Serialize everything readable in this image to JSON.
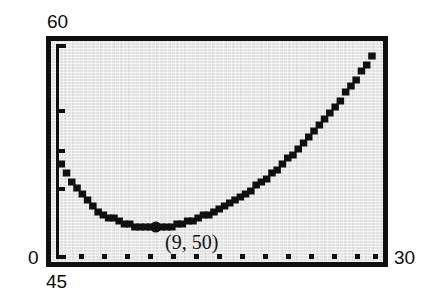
{
  "figure": {
    "kind": "graphing-calculator-screen",
    "screen_bg_color": "#e2e2e2",
    "ink_color": "#101010",
    "frame_color": "#101010"
  },
  "axis_labels": {
    "y_max": "60",
    "y_min": "0",
    "x_min": "45",
    "x_max": "30"
  },
  "annotation": {
    "point_label": "(9, 50)"
  },
  "chart_data": {
    "type": "line",
    "title": "",
    "subtitle": "",
    "xlabel": "",
    "ylabel": "",
    "xlim": [
      45,
      30
    ],
    "ylim": [
      0,
      60
    ],
    "grid": false,
    "legend": null,
    "axis_corner_labels": {
      "top_left": "60",
      "bottom_left_outside": "0",
      "below_bottom_left": "45",
      "bottom_right": "30"
    },
    "x_axis_tick_count": 15,
    "x_axis_tick_style": "dotted-marks-along-bottom",
    "y_axis_tick_count": 4,
    "y_axis_tick_style": "short-marks-on-left-axis",
    "y_axis_tick_values": [
      60,
      45,
      30,
      15
    ],
    "annotations": [
      {
        "text": "(9, 50)",
        "x": 9,
        "y": 50,
        "marker": "filled-circle"
      }
    ],
    "series": [
      {
        "name": "curve",
        "style": "thick-dotted-pixelated",
        "minimum": {
          "x": 9,
          "y": 50
        },
        "x": [
          0,
          0.5,
          1,
          1.5,
          2,
          2.5,
          3,
          3.5,
          4,
          4.5,
          5,
          5.5,
          6,
          6.5,
          7,
          7.5,
          8,
          8.5,
          9,
          9.5,
          10,
          10.5,
          11,
          11.5,
          12,
          12.5,
          13,
          13.5,
          14,
          14.5,
          15,
          15.5,
          16,
          16.5,
          17,
          17.5,
          18,
          18.5,
          19,
          19.5,
          20,
          20.5,
          21,
          21.5,
          22,
          22.5,
          23,
          23.5,
          24,
          24.5,
          25,
          25.5,
          26,
          26.5,
          27,
          27.5,
          28,
          28.5,
          29,
          29.5,
          30
        ],
        "y": [
          59.0,
          57.6,
          56.4,
          55.3,
          54.4,
          53.6,
          52.9,
          52.3,
          51.8,
          51.4,
          51.1,
          50.8,
          50.5,
          50.35,
          50.2,
          50.1,
          50.03,
          50.0,
          50.0,
          50.03,
          50.1,
          50.2,
          50.35,
          50.5,
          50.7,
          50.95,
          51.2,
          51.5,
          51.8,
          52.15,
          52.5,
          52.9,
          53.3,
          53.75,
          54.2,
          54.7,
          55.2,
          55.75,
          56.3,
          56.9,
          57.5,
          58.15,
          58.8,
          59.5,
          60.2,
          60.95,
          61.7,
          62.5,
          63.3,
          64.15,
          65.0,
          65.9,
          66.8,
          67.75,
          68.7,
          69.7,
          70.7,
          71.75,
          72.8,
          73.9,
          75.0
        ]
      }
    ]
  }
}
